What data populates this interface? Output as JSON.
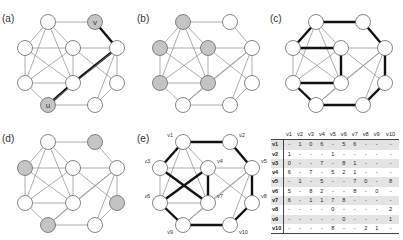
{
  "colors": {
    "edge": "#8a8a8a",
    "bold_edge": "#111111",
    "node_fill": "#ffffff",
    "node_stroke": "#666666",
    "highlight_fill": "#c4c4c4"
  },
  "nodes": [
    {
      "id": "n1",
      "x": 38,
      "y": 17
    },
    {
      "id": "n2",
      "x": 85,
      "y": 17
    },
    {
      "id": "n3",
      "x": 15,
      "y": 43
    },
    {
      "id": "n4",
      "x": 63,
      "y": 43
    },
    {
      "id": "n5",
      "x": 107,
      "y": 43
    },
    {
      "id": "n6",
      "x": 15,
      "y": 78
    },
    {
      "id": "n7",
      "x": 63,
      "y": 78
    },
    {
      "id": "n8",
      "x": 107,
      "y": 78
    },
    {
      "id": "n9",
      "x": 38,
      "y": 100
    },
    {
      "id": "n10",
      "x": 85,
      "y": 100
    }
  ],
  "edges": [
    [
      0,
      1
    ],
    [
      1,
      4
    ],
    [
      0,
      2
    ],
    [
      0,
      3
    ],
    [
      0,
      5
    ],
    [
      0,
      6
    ],
    [
      2,
      3
    ],
    [
      3,
      4
    ],
    [
      2,
      5
    ],
    [
      3,
      6
    ],
    [
      5,
      6
    ],
    [
      2,
      6
    ],
    [
      3,
      5
    ],
    [
      3,
      7
    ],
    [
      6,
      4
    ],
    [
      4,
      7
    ],
    [
      4,
      9
    ],
    [
      7,
      9
    ],
    [
      5,
      8
    ],
    [
      6,
      8
    ],
    [
      8,
      9
    ],
    [
      4,
      8
    ]
  ],
  "panels": [
    {
      "label": "(a)",
      "left": 10,
      "top": 5,
      "highlight": [
        1,
        8
      ],
      "node_text": {
        "1": "v",
        "8": "u"
      },
      "bold_edges": [
        [
          1,
          4
        ],
        [
          4,
          6
        ],
        [
          6,
          8
        ]
      ]
    },
    {
      "label": "(b)",
      "left": 145,
      "top": 5,
      "highlight": [
        0,
        2,
        3,
        5,
        6
      ],
      "node_text": {},
      "bold_edges": []
    },
    {
      "label": "(c)",
      "left": 278,
      "top": 5,
      "highlight": [],
      "node_text": {},
      "bold_edges": [
        [
          0,
          1
        ],
        [
          1,
          4
        ],
        [
          4,
          7
        ],
        [
          7,
          9
        ],
        [
          9,
          8
        ],
        [
          8,
          5
        ],
        [
          5,
          6
        ],
        [
          6,
          3
        ],
        [
          3,
          2
        ],
        [
          2,
          0
        ]
      ]
    },
    {
      "label": "(d)",
      "left": 10,
      "top": 125,
      "highlight": [
        1,
        2,
        7,
        8
      ],
      "node_text": {},
      "bold_edges": []
    },
    {
      "label": "(e)",
      "left": 145,
      "top": 125,
      "highlight": [],
      "node_text": {},
      "bold_edges": [
        [
          0,
          1
        ],
        [
          1,
          4
        ],
        [
          4,
          7
        ],
        [
          7,
          9
        ],
        [
          9,
          8
        ],
        [
          8,
          5
        ],
        [
          5,
          3
        ],
        [
          3,
          6
        ],
        [
          6,
          2
        ],
        [
          2,
          0
        ]
      ],
      "vertex_labels": [
        "v1",
        "v2",
        "v3",
        "v4",
        "v5",
        "v6",
        "v7",
        "v8",
        "v9",
        "v10"
      ]
    }
  ],
  "table": {
    "headers": [
      "v1",
      "v2",
      "v3",
      "v4",
      "v5",
      "v6",
      "v7",
      "v8",
      "v9",
      "v10"
    ],
    "rows": [
      {
        "label": "v1",
        "cells": [
          "-",
          "1",
          "0",
          "6",
          "-",
          "5",
          "6",
          "-",
          "-",
          "-"
        ]
      },
      {
        "label": "v2",
        "cells": [
          "1",
          "-",
          "-",
          "-",
          "1",
          "-",
          "-",
          "-",
          "-",
          "-"
        ]
      },
      {
        "label": "v3",
        "cells": [
          "0",
          "-",
          "-",
          "7",
          "-",
          "8",
          "1",
          "-",
          "-",
          "-"
        ]
      },
      {
        "label": "v4",
        "cells": [
          "6",
          "-",
          "7",
          "-",
          "5",
          "2",
          "1",
          "-",
          "-",
          "-"
        ]
      },
      {
        "label": "v5",
        "cells": [
          "-",
          "1",
          "-",
          "5",
          "-",
          "-",
          "7",
          "0",
          "-",
          "8"
        ]
      },
      {
        "label": "v6",
        "cells": [
          "5",
          "-",
          "8",
          "2",
          "-",
          "-",
          "8",
          "-",
          "0",
          "-"
        ]
      },
      {
        "label": "v7",
        "cells": [
          "6",
          "-",
          "1",
          "1",
          "7",
          "8",
          "-",
          "-",
          "-",
          "-"
        ]
      },
      {
        "label": "v8",
        "cells": [
          "-",
          "-",
          "-",
          "-",
          "0",
          "-",
          "-",
          "-",
          "-",
          "2"
        ]
      },
      {
        "label": "v9",
        "cells": [
          "-",
          "-",
          "-",
          "-",
          "-",
          "0",
          "-",
          "-",
          "-",
          "1"
        ]
      },
      {
        "label": "v10",
        "cells": [
          "-",
          "-",
          "-",
          "-",
          "8",
          "-",
          "-",
          "2",
          "1",
          "-"
        ]
      }
    ]
  }
}
